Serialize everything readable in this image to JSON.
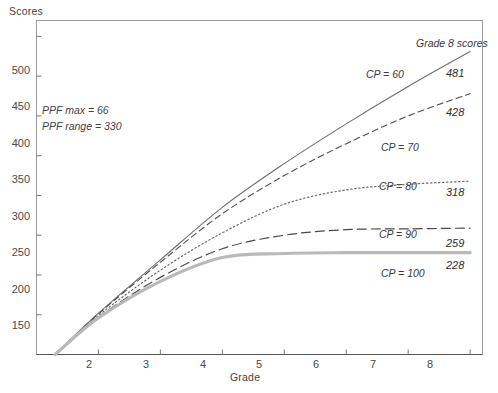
{
  "chart_data": {
    "type": "line",
    "title": "",
    "xlabel": "Grade",
    "ylabel": "Scores",
    "xlim": [
      1,
      8.2
    ],
    "ylim": [
      100,
      520
    ],
    "xticks": [
      2,
      3,
      4,
      5,
      6,
      7,
      8
    ],
    "yticks": [
      150,
      200,
      250,
      300,
      350,
      400,
      450,
      500
    ],
    "grid": false,
    "legend_position": "right-of-plot",
    "legend_header": "Grade 8 scores",
    "annotations": [
      "PPF max = 66",
      "PPF range = 330"
    ],
    "x": [
      1.3,
      2,
      3,
      4,
      5,
      6,
      7,
      8
    ],
    "series": [
      {
        "name": "CP = 60",
        "label": "CP = 60",
        "end_value": 481,
        "style": "solid-thin",
        "color": "#6e6e6e",
        "values": [
          100,
          152,
          219,
          285,
          340,
          390,
          437,
          481
        ]
      },
      {
        "name": "CP = 70",
        "label": "CP = 70",
        "end_value": 428,
        "style": "dashed",
        "color": "#4f4f4f",
        "values": [
          100,
          151,
          216,
          277,
          325,
          365,
          400,
          428
        ]
      },
      {
        "name": "CP = 80",
        "label": "CP = 80",
        "end_value": 318,
        "style": "dotted",
        "color": "#6a6a6a",
        "values": [
          100,
          149,
          206,
          253,
          289,
          307,
          314,
          318
        ]
      },
      {
        "name": "CP = 90",
        "label": "CP = 90",
        "end_value": 259,
        "style": "long-dash",
        "color": "#4a4a4a",
        "values": [
          100,
          147,
          197,
          233,
          250,
          257,
          258,
          259
        ]
      },
      {
        "name": "CP = 100",
        "label": "CP = 100",
        "end_value": 228,
        "style": "solid-thick-gray",
        "color": "#b9b9b9",
        "values": [
          100,
          146,
          192,
          222,
          227,
          228,
          228,
          228
        ]
      }
    ]
  },
  "axes": {
    "y_title": "Scores",
    "x_title": "Grade",
    "y_tick_labels": [
      "500",
      "450",
      "400",
      "350",
      "300",
      "250",
      "200",
      "150"
    ],
    "x_tick_labels": [
      "2",
      "3",
      "4",
      "5",
      "6",
      "7",
      "8"
    ]
  },
  "notes": {
    "ppf_max": "PPF max = 66",
    "ppf_range": "PPF range = 330"
  },
  "legend": {
    "header": "Grade 8 scores",
    "items": [
      {
        "label": "CP = 60",
        "value": "481"
      },
      {
        "label": "CP = 70",
        "value": "428"
      },
      {
        "label": "CP = 80",
        "value": "318"
      },
      {
        "label": "CP = 90",
        "value": "259"
      },
      {
        "label": "CP = 100",
        "value": "228"
      }
    ]
  }
}
